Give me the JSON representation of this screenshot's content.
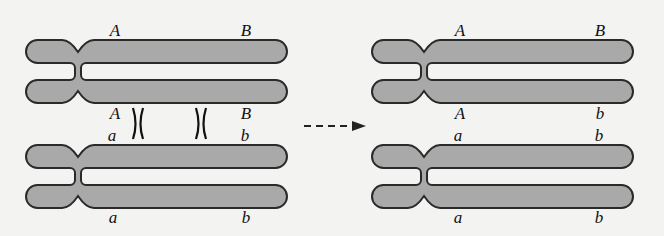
{
  "diagram": {
    "colors": {
      "chromosome_fill": "#a9a9a9",
      "outline": "#2a2a2a",
      "background": "#f3f3f1"
    },
    "before": {
      "top_chromosome": {
        "upper_labels": [
          "A",
          "B"
        ],
        "lower_labels": [
          "A",
          "B"
        ]
      },
      "bottom_chromosome": {
        "upper_labels": [
          "a",
          "b"
        ],
        "lower_labels": [
          "a",
          "b"
        ]
      },
      "crossover_marks": [
        "X",
        "X"
      ]
    },
    "arrow": {
      "style": "dashed",
      "direction": "right"
    },
    "after": {
      "top_chromosome": {
        "upper_labels": [
          "A",
          "B"
        ],
        "lower_labels": [
          "A",
          "b"
        ]
      },
      "bottom_chromosome": {
        "upper_labels": [
          "a",
          "b"
        ],
        "lower_labels": [
          "a",
          "b"
        ]
      }
    }
  }
}
